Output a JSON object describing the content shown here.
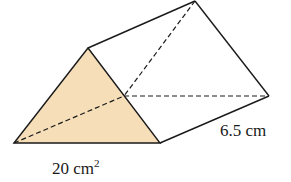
{
  "diagram": {
    "type": "triangular-prism",
    "colors": {
      "front_face_fill": "#f5deb8",
      "edge_stroke": "#1a1a1a",
      "background": "#ffffff"
    },
    "labels": {
      "length": "6.5 cm",
      "area_value": "20 cm",
      "area_exponent": "2"
    }
  }
}
